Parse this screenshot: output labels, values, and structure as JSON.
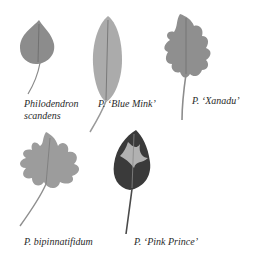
{
  "figure": {
    "background": "#ffffff",
    "leaves": [
      {
        "id": "philodendron-scandens",
        "caption_line1": "Philodendron",
        "caption_line2": "scandens",
        "color": "#8a8a8a"
      },
      {
        "id": "blue-mink",
        "caption": "P. ‘Blue Mink’",
        "color": "#a9a9a9"
      },
      {
        "id": "xanadu",
        "caption": "P. ‘Xanadu’",
        "color": "#8f8f8f"
      },
      {
        "id": "bipinnatifidum",
        "caption": "P. bipinnatifidum",
        "color": "#9a9a9a"
      },
      {
        "id": "pink-prince",
        "caption": "P. ‘Pink Prince’",
        "color": "#3a3a3a"
      }
    ]
  }
}
